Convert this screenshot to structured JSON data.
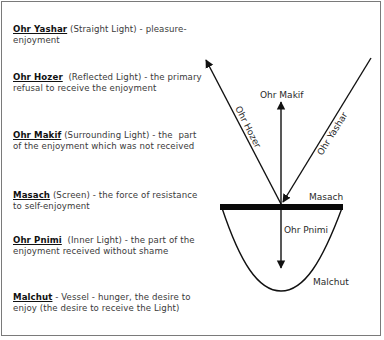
{
  "legend": [
    {
      "term": "Ohr Yashar",
      "rest": " (Straight Light) - pleasure-enjoyment",
      "top": 24
    },
    {
      "term": "Ohr Hozer",
      "rest": "  (Reflected Light) - the primary refusal to receive the enjoyment",
      "top": 72
    },
    {
      "term": "Ohr Makif",
      "rest": " (Surrounding Light) - the  part of the enjoyment which was not received",
      "top": 130
    },
    {
      "term": "Masach",
      "rest": " (Screen) - the force of resistance to self-enjoyment",
      "top": 190
    },
    {
      "term": "Ohr Pnimi",
      "rest": "  (Inner Light) - the part of the enjoyment received without shame",
      "top": 235
    },
    {
      "term": "Malchut",
      "rest": " - Vessel - hunger, the desire to enjoy (the desire to receive the Light)",
      "top": 292
    }
  ],
  "diagram": {
    "labels": {
      "ohr_makif": "Ohr Makif",
      "ohr_hozer": "Ohr Hozer",
      "ohr_yashar": "Ohr Yashar",
      "masach": "Masach",
      "ohr_pnimi": "Ohr Pnimi",
      "malchut": "Malchut"
    }
  }
}
